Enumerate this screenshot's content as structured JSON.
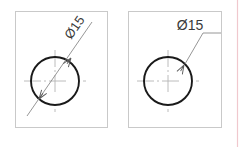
{
  "figure": {
    "type": "engineering-drawing",
    "background_color": "#ffffff",
    "panel_border_color": "#c9c9c9",
    "circle_color": "#1a1a1a",
    "centerline_color": "#b0b0b0",
    "leader_color": "#6e6e6e",
    "text_color": "#3a3a3a",
    "margin_rule_color": "#f0c8ce"
  },
  "panels": [
    {
      "id": "left-panel",
      "name": "incorrect-dimension-example",
      "frame": {
        "x": 15,
        "y": 11,
        "width": 93,
        "height": 117
      },
      "circle": {
        "cx": 55,
        "cy": 81,
        "r": 24
      },
      "centerline": {
        "horizontal": {
          "x1": 24,
          "y1": 81,
          "x2": 86,
          "y2": 81
        },
        "vertical": {
          "x1": 55,
          "y1": 50,
          "x2": 55,
          "y2": 112
        }
      },
      "dimension": {
        "label": "Ø15",
        "style": "diagonal-through-circle",
        "text_rotation_deg": -55,
        "text_x": 78,
        "text_y": 30,
        "leader": {
          "x1": 26,
          "y1": 117,
          "x2": 93,
          "y2": 21
        },
        "arrowheads": [
          {
            "at": "upper-right",
            "x": 71,
            "y": 58,
            "angle_deg": 125
          },
          {
            "at": "lower-left",
            "x": 38,
            "y": 100,
            "angle_deg": -55
          }
        ]
      }
    },
    {
      "id": "right-panel",
      "name": "correct-dimension-example",
      "frame": {
        "x": 128,
        "y": 11,
        "width": 94,
        "height": 117
      },
      "circle": {
        "cx": 168,
        "cy": 81,
        "r": 24
      },
      "centerline": {
        "horizontal": {
          "x1": 137,
          "y1": 81,
          "x2": 199,
          "y2": 81
        },
        "vertical": {
          "x1": 168,
          "y1": 50,
          "x2": 168,
          "y2": 112
        }
      },
      "dimension": {
        "label": "Ø15",
        "style": "leader-with-horizontal-shelf",
        "text_rotation_deg": 0,
        "text_x": 189,
        "text_y": 29,
        "leader_segments": [
          {
            "x1": 184,
            "y1": 65,
            "x2": 202,
            "y2": 33
          },
          {
            "x1": 202,
            "y1": 33,
            "x2": 220,
            "y2": 33
          }
        ],
        "arrowheads": [
          {
            "at": "circle-edge-upper-right",
            "x": 184,
            "y": 65,
            "angle_deg": 119
          }
        ]
      }
    }
  ],
  "margin_rule": {
    "x": 237,
    "y1": 0,
    "y2": 147
  }
}
